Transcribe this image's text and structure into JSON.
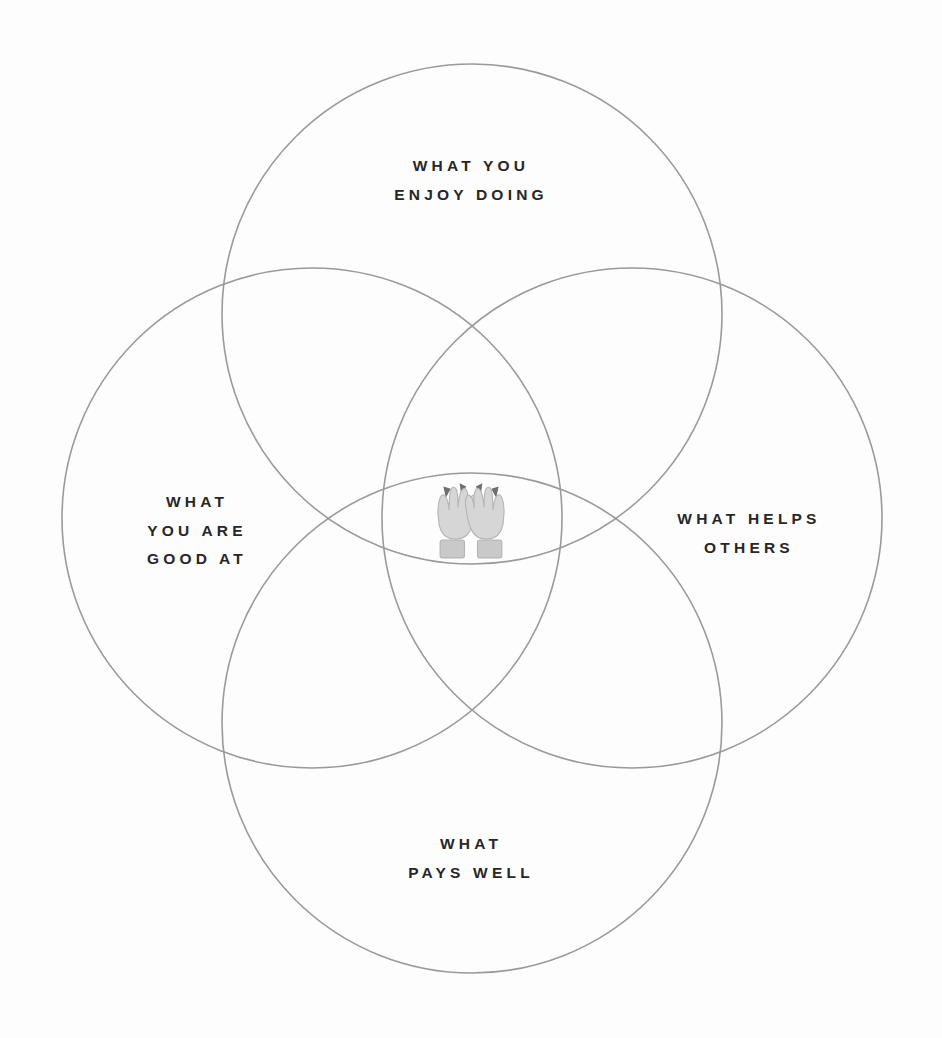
{
  "canvas": {
    "width": 942,
    "height": 1038,
    "background_color": "#fdfdfd"
  },
  "diagram": {
    "type": "venn",
    "title_visible": false,
    "circle_count": 4,
    "stroke_color": "#9a9a9a",
    "stroke_width": 1.6,
    "text_color": "#262626",
    "circles": [
      {
        "id": "enjoy",
        "position": "top",
        "cx": 472,
        "cy": 314,
        "r": 250
      },
      {
        "id": "goodat",
        "position": "left",
        "cx": 312,
        "cy": 518,
        "r": 250
      },
      {
        "id": "helps",
        "position": "right",
        "cx": 632,
        "cy": 518,
        "r": 250
      },
      {
        "id": "pays",
        "position": "bottom",
        "cx": 472,
        "cy": 723,
        "r": 250
      }
    ]
  },
  "labels": {
    "top": "WHAT YOU\nENJOY DOING",
    "left": "WHAT\nYOU ARE\nGOOD AT",
    "right": "WHAT HELPS\nOTHERS",
    "bottom": "WHAT\nPAYS WELL"
  },
  "center": {
    "icon_name": "raising-hands-emoji",
    "glyph": "🙌",
    "description": "raising hands"
  }
}
